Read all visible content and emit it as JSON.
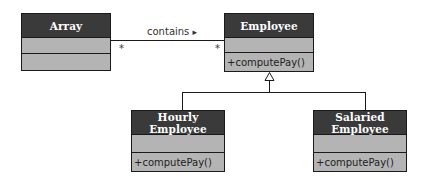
{
  "diagram": {
    "type": "uml-class-diagram",
    "classes": [
      {
        "name": "Array",
        "attributes": "",
        "methods": ""
      },
      {
        "name": "Employee",
        "attributes": "",
        "methods": "+computePay()"
      },
      {
        "name": "Hourly Employee",
        "attributes": "",
        "methods": "+computePay()"
      },
      {
        "name": "Salaried Employee",
        "attributes": "",
        "methods": "+computePay()"
      }
    ],
    "association": {
      "label": "contains",
      "direction_glyph": "▸",
      "from": "Array",
      "to": "Employee",
      "from_multiplicity": "*",
      "to_multiplicity": "*"
    },
    "generalization": {
      "parent": "Employee",
      "children": [
        "Hourly Employee",
        "Salaried Employee"
      ]
    },
    "colors": {
      "header": "#3a3a3a",
      "header_text": "#ffffff",
      "compartment": "#b4b4b4",
      "line": "#1a1a1a"
    }
  }
}
